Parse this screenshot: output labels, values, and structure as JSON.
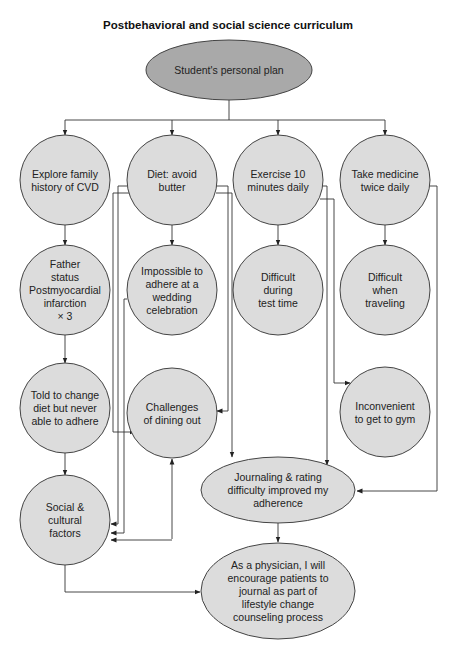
{
  "title": "Postbehavioral and social science curriculum",
  "colors": {
    "root_fill": "#a9a9a9",
    "node_fill": "#dcdcdc",
    "stroke": "#444444"
  },
  "nodes": {
    "root": {
      "lines": [
        "Student's personal plan"
      ]
    },
    "family_history": {
      "lines": [
        "Explore family",
        "history of CVD"
      ]
    },
    "diet": {
      "lines": [
        "Diet: avoid",
        "butter"
      ]
    },
    "exercise": {
      "lines": [
        "Exercise 10",
        "minutes daily"
      ]
    },
    "medicine": {
      "lines": [
        "Take medicine",
        "twice daily"
      ]
    },
    "father_status": {
      "lines": [
        "Father",
        "status",
        "Postmyocardial",
        "infarction",
        "× 3"
      ]
    },
    "wedding": {
      "lines": [
        "Impossible to",
        "adhere at a",
        "wedding",
        "celebration"
      ]
    },
    "test_time": {
      "lines": [
        "Difficult",
        "during",
        "test time"
      ]
    },
    "traveling": {
      "lines": [
        "Difficult",
        "when",
        "traveling"
      ]
    },
    "told_change": {
      "lines": [
        "Told to change",
        "diet but never",
        "able to adhere"
      ]
    },
    "dining_out": {
      "lines": [
        "Challenges",
        "of dining out"
      ]
    },
    "gym": {
      "lines": [
        "Inconvenient",
        "to get to gym"
      ]
    },
    "social": {
      "lines": [
        "Social &",
        "cultural",
        "factors"
      ]
    },
    "journaling": {
      "lines": [
        "Journaling & rating",
        "difficulty improved my",
        "adherence"
      ]
    },
    "physician": {
      "lines": [
        "As a physician, I will",
        "encourage patients to",
        "journal as part of",
        "lifestyle change",
        "counseling process"
      ]
    }
  },
  "edges": [
    [
      "root",
      "family_history"
    ],
    [
      "root",
      "diet"
    ],
    [
      "root",
      "exercise"
    ],
    [
      "root",
      "medicine"
    ],
    [
      "family_history",
      "father_status"
    ],
    [
      "father_status",
      "told_change"
    ],
    [
      "told_change",
      "social"
    ],
    [
      "diet",
      "wedding"
    ],
    [
      "diet",
      "dining_out"
    ],
    [
      "diet",
      "social"
    ],
    [
      "wedding",
      "social"
    ],
    [
      "told_change",
      "dining_out"
    ],
    [
      "exercise",
      "test_time"
    ],
    [
      "exercise",
      "dining_out"
    ],
    [
      "exercise",
      "gym"
    ],
    [
      "exercise",
      "journaling"
    ],
    [
      "medicine",
      "traveling"
    ],
    [
      "medicine",
      "journaling"
    ],
    [
      "dining_out",
      "social"
    ],
    [
      "diet",
      "journaling"
    ],
    [
      "journaling",
      "physician"
    ],
    [
      "social",
      "physician"
    ]
  ]
}
